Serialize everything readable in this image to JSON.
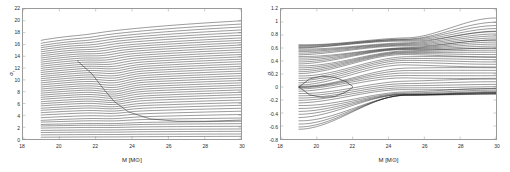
{
  "figure": {
    "background_color": "#ffffff",
    "axis_color": "#9a9a9a",
    "curve_color": "#1a1a1a",
    "panel_count": 2
  },
  "chart_data": [
    {
      "type": "line",
      "panel": "left",
      "title": "",
      "xlabel": "M [M⊙]",
      "ylabel": "σ",
      "ylabel_subscript": "r",
      "xlim": [
        18,
        30
      ],
      "ylim": [
        0,
        22
      ],
      "xticks": [
        18,
        20,
        22,
        24,
        26,
        28,
        30
      ],
      "xticklabels": [
        "18",
        "20",
        "22",
        "24",
        "26",
        "28",
        "30"
      ],
      "yticks": [
        0,
        2,
        4,
        6,
        8,
        10,
        12,
        14,
        16,
        18,
        20,
        22
      ],
      "yticklabels": [
        "0",
        "2",
        "4",
        "6",
        "8",
        "10",
        "12",
        "14",
        "16",
        "18",
        "20",
        "22"
      ],
      "grid": false,
      "legend": "none",
      "data_start_x": 19.0,
      "data_end_x": 30.0,
      "n_series": 46,
      "description": "Dense family of nearly parallel ascending eigenvalue branches; each branch begins at M=19 and rises monotonically toward M=30. Branch start values span 0.15 to 16.7; end values span 0.6 to 20.0. A distinctive descending/avoided-crossing feature appears near M=22-24 in the lower-middle region, and a dense sub-horizontal bundle fills the lower part of the panel.",
      "series": [
        {
          "name": "branch-1",
          "y_start": 16.7,
          "y_end": 20.0,
          "bow": 0.3,
          "kink_x": 21.5,
          "kink_amp": 0.05
        },
        {
          "name": "branch-2",
          "y_start": 16.2,
          "y_end": 19.45,
          "bow": 0.3,
          "kink_x": 21.6,
          "kink_amp": 0.06
        },
        {
          "name": "branch-3",
          "y_start": 15.8,
          "y_end": 18.95,
          "bow": 0.28,
          "kink_x": 21.7,
          "kink_amp": 0.07
        },
        {
          "name": "branch-4",
          "y_start": 15.45,
          "y_end": 18.45,
          "bow": 0.28,
          "kink_x": 21.8,
          "kink_amp": 0.08
        },
        {
          "name": "branch-5",
          "y_start": 15.1,
          "y_end": 18.0,
          "bow": 0.26,
          "kink_x": 21.9,
          "kink_amp": 0.09
        },
        {
          "name": "branch-6",
          "y_start": 14.75,
          "y_end": 17.55,
          "bow": 0.26,
          "kink_x": 22.0,
          "kink_amp": 0.1
        },
        {
          "name": "branch-7",
          "y_start": 14.4,
          "y_end": 17.1,
          "bow": 0.24,
          "kink_x": 22.1,
          "kink_amp": 0.11
        },
        {
          "name": "branch-8",
          "y_start": 14.05,
          "y_end": 16.7,
          "bow": 0.24,
          "kink_x": 22.2,
          "kink_amp": 0.12
        },
        {
          "name": "branch-9",
          "y_start": 13.7,
          "y_end": 16.3,
          "bow": 0.22,
          "kink_x": 22.3,
          "kink_amp": 0.13
        },
        {
          "name": "branch-10",
          "y_start": 13.35,
          "y_end": 15.9,
          "bow": 0.22,
          "kink_x": 22.4,
          "kink_amp": 0.14
        },
        {
          "name": "branch-11",
          "y_start": 13.0,
          "y_end": 15.5,
          "bow": 0.2,
          "kink_x": 22.5,
          "kink_amp": 0.15
        },
        {
          "name": "branch-12",
          "y_start": 12.65,
          "y_end": 15.1,
          "bow": 0.2,
          "kink_x": 22.6,
          "kink_amp": 0.16
        },
        {
          "name": "branch-13",
          "y_start": 12.3,
          "y_end": 14.7,
          "bow": 0.19,
          "kink_x": 22.7,
          "kink_amp": 0.17
        },
        {
          "name": "branch-14",
          "y_start": 11.95,
          "y_end": 14.3,
          "bow": 0.19,
          "kink_x": 22.8,
          "kink_amp": 0.18
        },
        {
          "name": "branch-15",
          "y_start": 11.6,
          "y_end": 13.9,
          "bow": 0.18,
          "kink_x": 22.9,
          "kink_amp": 0.19
        },
        {
          "name": "branch-16",
          "y_start": 11.25,
          "y_end": 13.5,
          "bow": 0.18,
          "kink_x": 23.0,
          "kink_amp": 0.2
        },
        {
          "name": "branch-17",
          "y_start": 10.9,
          "y_end": 13.1,
          "bow": 0.17,
          "kink_x": 23.0,
          "kink_amp": 0.21
        },
        {
          "name": "branch-18",
          "y_start": 10.55,
          "y_end": 12.7,
          "bow": 0.17,
          "kink_x": 23.0,
          "kink_amp": 0.22
        },
        {
          "name": "branch-19",
          "y_start": 10.2,
          "y_end": 12.3,
          "bow": 0.16,
          "kink_x": 23.0,
          "kink_amp": 0.23
        },
        {
          "name": "branch-20",
          "y_start": 9.85,
          "y_end": 11.9,
          "bow": 0.16,
          "kink_x": 23.0,
          "kink_amp": 0.24
        },
        {
          "name": "branch-21",
          "y_start": 9.5,
          "y_end": 11.5,
          "bow": 0.15,
          "kink_x": 23.0,
          "kink_amp": 0.25
        },
        {
          "name": "branch-22",
          "y_start": 9.15,
          "y_end": 11.1,
          "bow": 0.15,
          "kink_x": 23.0,
          "kink_amp": 0.26
        },
        {
          "name": "branch-23",
          "y_start": 8.8,
          "y_end": 10.7,
          "bow": 0.14,
          "kink_x": 23.0,
          "kink_amp": 0.27
        },
        {
          "name": "branch-24",
          "y_start": 8.45,
          "y_end": 10.3,
          "bow": 0.14,
          "kink_x": 23.0,
          "kink_amp": 0.28
        },
        {
          "name": "branch-25",
          "y_start": 8.1,
          "y_end": 9.9,
          "bow": 0.13,
          "kink_x": 23.0,
          "kink_amp": 0.28
        },
        {
          "name": "branch-26",
          "y_start": 7.75,
          "y_end": 9.5,
          "bow": 0.13,
          "kink_x": 23.0,
          "kink_amp": 0.28
        },
        {
          "name": "branch-27",
          "y_start": 7.4,
          "y_end": 9.1,
          "bow": 0.12,
          "kink_x": 23.0,
          "kink_amp": 0.27
        },
        {
          "name": "branch-28",
          "y_start": 7.05,
          "y_end": 8.7,
          "bow": 0.12,
          "kink_x": 23.0,
          "kink_amp": 0.26
        },
        {
          "name": "branch-29",
          "y_start": 6.7,
          "y_end": 8.3,
          "bow": 0.11,
          "kink_x": 23.0,
          "kink_amp": 0.25
        },
        {
          "name": "branch-30",
          "y_start": 6.3,
          "y_end": 7.9,
          "bow": 0.11,
          "kink_x": 23.0,
          "kink_amp": 0.24
        },
        {
          "name": "branch-31",
          "y_start": 5.95,
          "y_end": 7.5,
          "bow": 0.1,
          "kink_x": 23.0,
          "kink_amp": 0.22
        },
        {
          "name": "branch-32",
          "y_start": 5.6,
          "y_end": 7.05,
          "bow": 0.1,
          "kink_x": 23.0,
          "kink_amp": 0.2
        },
        {
          "name": "branch-33",
          "y_start": 5.2,
          "y_end": 6.6,
          "bow": 0.09,
          "kink_x": 23.0,
          "kink_amp": 0.18
        },
        {
          "name": "branch-34",
          "y_start": 4.85,
          "y_end": 6.15,
          "bow": 0.09,
          "kink_x": 23.0,
          "kink_amp": 0.16
        },
        {
          "name": "branch-35",
          "y_start": 4.45,
          "y_end": 5.7,
          "bow": 0.08,
          "kink_x": 23.0,
          "kink_amp": 0.14
        },
        {
          "name": "branch-36",
          "y_start": 4.05,
          "y_end": 5.2,
          "bow": 0.08,
          "kink_x": 23.0,
          "kink_amp": 0.12
        },
        {
          "name": "branch-37",
          "y_start": 3.6,
          "y_end": 4.7,
          "bow": 0.07,
          "kink_x": 23.0,
          "kink_amp": 0.1
        },
        {
          "name": "branch-38",
          "y_start": 3.15,
          "y_end": 4.15,
          "bow": 0.07,
          "kink_x": 23.0,
          "kink_amp": 0.08
        },
        {
          "name": "branch-39",
          "y_start": 2.85,
          "y_end": 3.55,
          "bow": 0.06,
          "kink_x": 23.0,
          "kink_amp": 0.06
        },
        {
          "name": "branch-40",
          "y_start": 2.45,
          "y_end": 3.0,
          "bow": 0.05,
          "kink_x": 23.0,
          "kink_amp": 0.05
        },
        {
          "name": "branch-41",
          "y_start": 2.2,
          "y_end": 2.6,
          "bow": 0.04,
          "kink_x": 23.0,
          "kink_amp": 0.04
        },
        {
          "name": "branch-42",
          "y_start": 1.85,
          "y_end": 2.15,
          "bow": 0.04,
          "kink_x": 23.0,
          "kink_amp": 0.03
        },
        {
          "name": "branch-43",
          "y_start": 1.45,
          "y_end": 1.7,
          "bow": 0.03,
          "kink_x": 23.0,
          "kink_amp": 0.02
        },
        {
          "name": "branch-44",
          "y_start": 1.1,
          "y_end": 1.3,
          "bow": 0.02,
          "kink_x": 23.0,
          "kink_amp": 0.02
        },
        {
          "name": "branch-45",
          "y_start": 0.7,
          "y_end": 0.85,
          "bow": 0.02,
          "kink_x": 23.0,
          "kink_amp": 0.01
        },
        {
          "name": "branch-46",
          "y_start": 0.3,
          "y_end": 0.45,
          "bow": 0.01,
          "kink_x": 23.0,
          "kink_amp": 0.01
        }
      ],
      "descending_feature": {
        "description": "Sweeping descending branch crossing the ascending family between M=21 and M=26",
        "points": [
          [
            21.0,
            13.2
          ],
          [
            21.8,
            11.0
          ],
          [
            22.4,
            8.6
          ],
          [
            23.0,
            6.4
          ],
          [
            23.8,
            4.6
          ],
          [
            25.0,
            3.4
          ],
          [
            26.5,
            3.0
          ],
          [
            28.0,
            3.0
          ],
          [
            30.0,
            3.2
          ]
        ]
      }
    },
    {
      "type": "line",
      "panel": "right",
      "title": "",
      "xlabel": "M [M⊙]",
      "ylabel": "σ",
      "ylabel_subscript": "i",
      "xlim": [
        18,
        30
      ],
      "ylim": [
        -0.8,
        1.2
      ],
      "xticks": [
        18,
        20,
        22,
        24,
        26,
        28,
        30
      ],
      "xticklabels": [
        "18",
        "20",
        "22",
        "24",
        "26",
        "28",
        "30"
      ],
      "yticks": [
        -0.8,
        -0.6,
        -0.4,
        -0.2,
        0,
        0.2,
        0.4,
        0.6,
        0.8,
        1.0,
        1.2
      ],
      "yticklabels": [
        "-0.8",
        "-0.6",
        "-0.4",
        "-0.2",
        "0",
        "0.2",
        "0.4",
        "0.6",
        "0.8",
        "1",
        "1.2"
      ],
      "grid": false,
      "legend": "none",
      "data_start_x": 19.0,
      "data_end_x": 30.0,
      "n_series": 44,
      "description": "Imaginary parts of the eigenvalue spectrum. Curves start at M=19 spread between -0.65 and +0.65. A narrow lens (eye) shape straddles sigma_i = 0 between M=19 and M=22. A dense criss-cross convergence region forms near M=24-26 around sigma_i = 0.6, after which branches fan out, the highest reaching +1.05 at M=30 and the lowest settling near -0.1.",
      "series": [
        {
          "name": "branch-1",
          "y_start": 0.65,
          "y_mid": 0.76,
          "y_end": 1.05
        },
        {
          "name": "branch-2",
          "y_start": 0.64,
          "y_mid": 0.74,
          "y_end": 0.99
        },
        {
          "name": "branch-3",
          "y_start": 0.625,
          "y_mid": 0.73,
          "y_end": 0.945
        },
        {
          "name": "branch-4",
          "y_start": 0.61,
          "y_mid": 0.715,
          "y_end": 0.905
        },
        {
          "name": "branch-5",
          "y_start": 0.6,
          "y_mid": 0.7,
          "y_end": 0.87
        },
        {
          "name": "branch-6",
          "y_start": 0.585,
          "y_mid": 0.685,
          "y_end": 0.84
        },
        {
          "name": "branch-7",
          "y_start": 0.565,
          "y_mid": 0.67,
          "y_end": 0.81
        },
        {
          "name": "branch-8",
          "y_start": 0.545,
          "y_mid": 0.655,
          "y_end": 0.785
        },
        {
          "name": "branch-9",
          "y_start": 0.52,
          "y_mid": 0.64,
          "y_end": 0.76
        },
        {
          "name": "branch-10",
          "y_start": 0.495,
          "y_mid": 0.625,
          "y_end": 0.735
        },
        {
          "name": "branch-11",
          "y_start": 0.47,
          "y_mid": 0.61,
          "y_end": 0.71
        },
        {
          "name": "branch-12",
          "y_start": 0.445,
          "y_mid": 0.6,
          "y_end": 0.685
        },
        {
          "name": "branch-13",
          "y_start": 0.415,
          "y_mid": 0.59,
          "y_end": 0.66
        },
        {
          "name": "branch-14",
          "y_start": 0.385,
          "y_mid": 0.58,
          "y_end": 0.635
        },
        {
          "name": "branch-15",
          "y_start": 0.355,
          "y_mid": 0.57,
          "y_end": 0.61
        },
        {
          "name": "branch-16",
          "y_start": 0.325,
          "y_mid": 0.56,
          "y_end": 0.585
        },
        {
          "name": "branch-17",
          "y_start": 0.295,
          "y_mid": 0.545,
          "y_end": 0.56
        },
        {
          "name": "branch-18",
          "y_start": 0.265,
          "y_mid": 0.53,
          "y_end": 0.535
        },
        {
          "name": "branch-19",
          "y_start": 0.235,
          "y_mid": 0.515,
          "y_end": 0.505
        },
        {
          "name": "branch-20",
          "y_start": 0.205,
          "y_mid": 0.495,
          "y_end": 0.475
        },
        {
          "name": "branch-21",
          "y_start": 0.17,
          "y_mid": 0.47,
          "y_end": 0.445
        },
        {
          "name": "branch-22",
          "y_start": 0.135,
          "y_mid": 0.44,
          "y_end": 0.415
        },
        {
          "name": "branch-23",
          "y_start": 0.1,
          "y_mid": 0.41,
          "y_end": 0.385
        },
        {
          "name": "branch-24",
          "y_start": 0.065,
          "y_mid": 0.375,
          "y_end": 0.355
        },
        {
          "name": "branch-25",
          "y_start": 0.03,
          "y_mid": 0.335,
          "y_end": 0.32
        },
        {
          "name": "branch-26",
          "y_start": 0.01,
          "y_mid": 0.295,
          "y_end": 0.285
        },
        {
          "name": "branch-27",
          "y_start": 0.0,
          "y_mid": 0.255,
          "y_end": 0.25
        },
        {
          "name": "branch-28",
          "y_start": -0.01,
          "y_mid": 0.215,
          "y_end": 0.215
        },
        {
          "name": "branch-29",
          "y_start": -0.03,
          "y_mid": 0.175,
          "y_end": 0.18
        },
        {
          "name": "branch-30",
          "y_start": -0.065,
          "y_mid": 0.135,
          "y_end": 0.145
        },
        {
          "name": "branch-31",
          "y_start": -0.1,
          "y_mid": 0.095,
          "y_end": 0.11
        },
        {
          "name": "branch-32",
          "y_start": -0.135,
          "y_mid": 0.055,
          "y_end": 0.075
        },
        {
          "name": "branch-33",
          "y_start": -0.17,
          "y_mid": 0.02,
          "y_end": 0.04
        },
        {
          "name": "branch-34",
          "y_start": -0.205,
          "y_mid": -0.015,
          "y_end": 0.01
        },
        {
          "name": "branch-35",
          "y_start": -0.245,
          "y_mid": -0.045,
          "y_end": -0.015
        },
        {
          "name": "branch-36",
          "y_start": -0.285,
          "y_mid": -0.07,
          "y_end": -0.035
        },
        {
          "name": "branch-37",
          "y_start": -0.33,
          "y_mid": -0.09,
          "y_end": -0.055
        },
        {
          "name": "branch-38",
          "y_start": -0.375,
          "y_mid": -0.105,
          "y_end": -0.07
        },
        {
          "name": "branch-39",
          "y_start": -0.42,
          "y_mid": -0.115,
          "y_end": -0.08
        },
        {
          "name": "branch-40",
          "y_start": -0.47,
          "y_mid": -0.12,
          "y_end": -0.09
        },
        {
          "name": "branch-41",
          "y_start": -0.52,
          "y_mid": -0.122,
          "y_end": -0.095
        },
        {
          "name": "branch-42",
          "y_start": -0.57,
          "y_mid": -0.124,
          "y_end": -0.1
        },
        {
          "name": "branch-43",
          "y_start": -0.615,
          "y_mid": -0.125,
          "y_end": -0.103
        },
        {
          "name": "branch-44",
          "y_start": -0.65,
          "y_mid": -0.126,
          "y_end": -0.105
        }
      ],
      "lens_feature": {
        "description": "Lens / eye shaped pair of branches enclosing sigma_i = 0 between M = 19 and M = 22",
        "upper": [
          [
            19.0,
            0.0
          ],
          [
            19.6,
            0.125
          ],
          [
            20.3,
            0.165
          ],
          [
            21.0,
            0.15
          ],
          [
            21.6,
            0.085
          ],
          [
            22.0,
            0.01
          ]
        ],
        "lower": [
          [
            19.0,
            0.0
          ],
          [
            19.6,
            -0.12
          ],
          [
            20.3,
            -0.16
          ],
          [
            21.0,
            -0.145
          ],
          [
            21.6,
            -0.08
          ],
          [
            22.0,
            -0.008
          ]
        ]
      },
      "convergence_feature": {
        "description": "Dense criss-cross convergence knot",
        "x_range": [
          24.0,
          26.5
        ],
        "y_center": 0.6
      }
    }
  ]
}
